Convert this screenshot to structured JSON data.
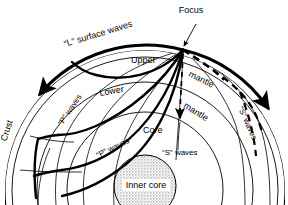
{
  "figure": {
    "type": "cross-section-diagram",
    "background_color": "#ffffff",
    "line_color": "#000000",
    "inner_core_fill": "#c9c9c9"
  },
  "labels": {
    "focus": "Focus",
    "l_surface_waves": "“L” surface waves",
    "upper": "Upper",
    "mantle_upper": "mantle",
    "mantle_lower": "mantle",
    "lower": "Lower",
    "crust": "Crust",
    "core": "Core",
    "inner_core": "Inner core",
    "p_waves_left": "“P” waves",
    "p_waves_bottom": "“P” waves",
    "s_waves_center": "“S” waves",
    "s_waves_right": "“S” waves"
  },
  "layers": [
    {
      "name": "crust",
      "label": "Crust",
      "radius": 140
    },
    {
      "name": "upper-mantle",
      "label": "Upper mantle",
      "radius": 133
    },
    {
      "name": "lower-mantle",
      "label": "Lower mantle",
      "radius": 108
    },
    {
      "name": "outer-core",
      "label": "Core",
      "radius": 78
    },
    {
      "name": "inner-core",
      "label": "Inner core",
      "radius": 31
    }
  ],
  "wave_types": [
    {
      "name": "L",
      "description": "surface waves",
      "style": "thick-solid-arc"
    },
    {
      "name": "P",
      "description": "compressional body waves",
      "style": "thick-solid-ray"
    },
    {
      "name": "S",
      "description": "shear body waves",
      "style": "dashed-ray"
    }
  ],
  "focus_point": {
    "x": 183,
    "y": 50
  }
}
